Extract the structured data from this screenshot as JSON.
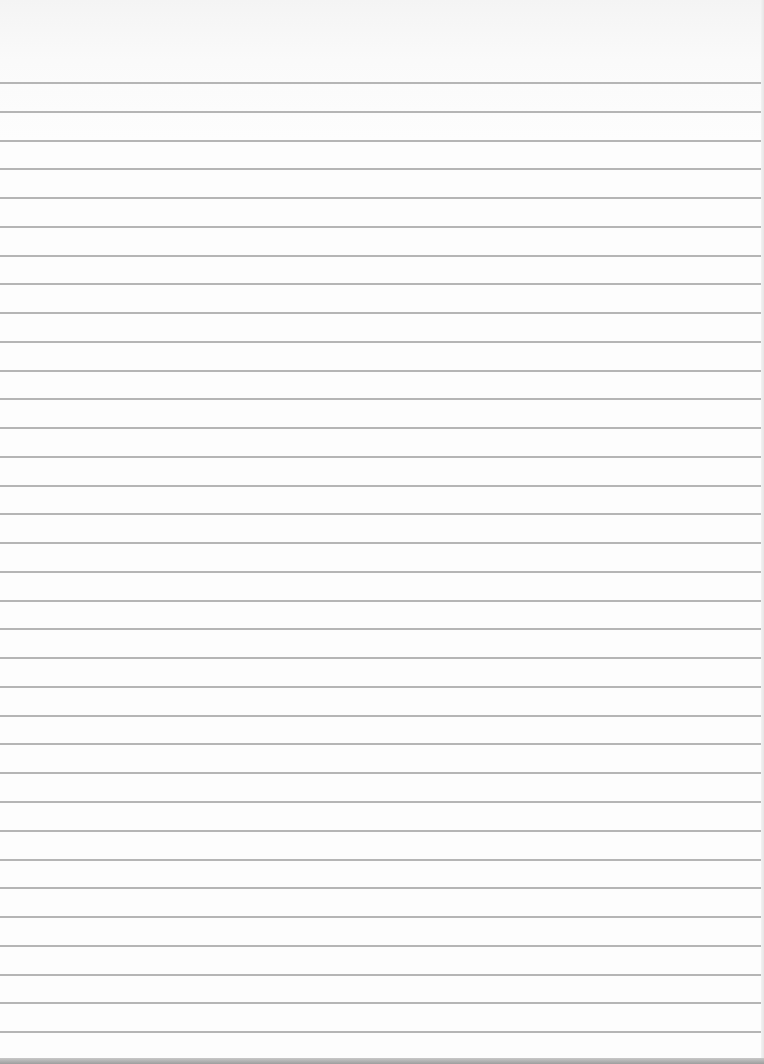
{
  "page": {
    "type": "lined-paper-scan",
    "background_color": "#fdfdfd",
    "rule_color": "#a8a8a8",
    "bottom_strip_color": "#a0a0a0"
  },
  "rules": {
    "count": 34,
    "first_y": 82,
    "spacing": 28.76
  }
}
